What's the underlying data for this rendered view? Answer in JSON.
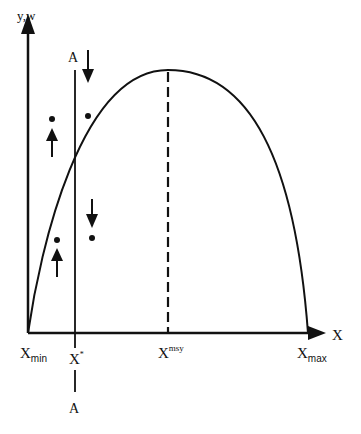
{
  "diagram": {
    "type": "population-harvest curve",
    "colors": {
      "stroke": "#111111",
      "background": "#ffffff"
    },
    "axes": {
      "y_label": "y,w",
      "x_label": "X"
    },
    "x_ticks": {
      "xmin": {
        "base": "X",
        "sub": "min"
      },
      "xstar": {
        "base": "X",
        "sup": "*"
      },
      "xmsy": {
        "base": "X",
        "sup": "msy"
      },
      "xmax": {
        "base": "X",
        "sub": "max"
      }
    },
    "line_a": {
      "top_label": "A",
      "bottom_label": "A"
    },
    "curve": {
      "start": [
        28,
        333
      ],
      "peak": [
        168,
        70
      ],
      "end": [
        308,
        333
      ]
    },
    "points": [
      {
        "x": 50,
        "y": 118,
        "arrow": "up"
      },
      {
        "x": 88,
        "y": 116,
        "arrow": "down"
      },
      {
        "x": 57,
        "y": 240,
        "arrow": "up"
      },
      {
        "x": 92,
        "y": 238,
        "arrow": "down"
      }
    ]
  }
}
